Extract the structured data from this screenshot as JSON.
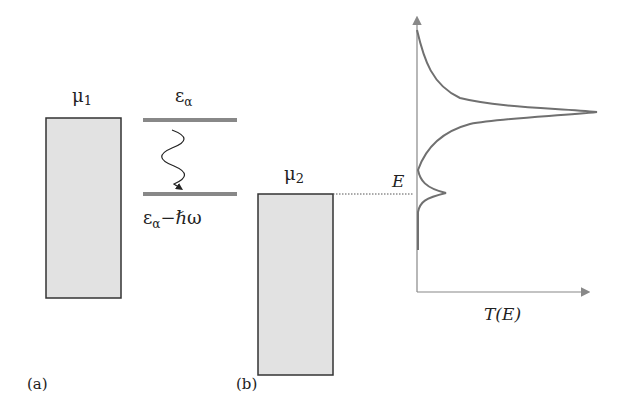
{
  "panel_a": {
    "label": "(a)",
    "reservoir_label": "μ",
    "reservoir_sub": "1",
    "upper_level_label": "ε",
    "upper_level_sub": "α",
    "lower_level_label": "ε",
    "lower_level_sub": "α",
    "lower_level_suffix": "−ℏω",
    "transition": "wavy-photon-emission-arrow"
  },
  "panel_b": {
    "label": "(b)",
    "reservoir_label": "μ",
    "reservoir_sub": "2",
    "energy_label": "E",
    "xaxis_label": "T(E)",
    "curve_description": "transmission T(E) vs energy with large Lorentzian peak and small sideband peak at E"
  },
  "colors": {
    "reservoir_fill": "#e2e2e2",
    "reservoir_stroke": "#333333",
    "level_line": "#888888",
    "curve": "#707070",
    "axis": "#888888"
  }
}
